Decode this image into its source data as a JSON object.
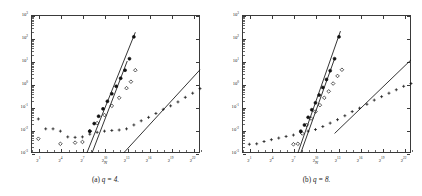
{
  "figure": {
    "panels": [
      {
        "id": "panel-a",
        "caption_prefix": "(a)",
        "caption_expr": "q = 4.",
        "caption_full": "(a) q = 4.",
        "axis": {
          "xlabel": "N",
          "ylabel": "",
          "x_ticks": [
            "2^1",
            "2^4",
            "2^7",
            "2^10",
            "2^13",
            "2^16",
            "2^19",
            "2^22"
          ],
          "x_tick_bases": [
            "2",
            "2",
            "2",
            "2",
            "2",
            "2",
            "2",
            "2"
          ],
          "x_tick_exps": [
            "1",
            "4",
            "7",
            "10",
            "13",
            "16",
            "19",
            "22"
          ],
          "y_ticks": [
            "10^3",
            "10^2",
            "10^1",
            "10^0",
            "10^-1",
            "10^-2",
            "10^-3"
          ],
          "y_tick_bases": [
            "10",
            "10",
            "10",
            "10",
            "10",
            "10",
            "10"
          ],
          "y_tick_exps": [
            "3",
            "2",
            "1",
            "0",
            "-1",
            "-2",
            "-3"
          ],
          "xlim_log2": [
            0,
            23
          ],
          "ylim_log10": [
            -3,
            3
          ],
          "xscale": "log2",
          "yscale": "log10",
          "grid": false
        }
      },
      {
        "id": "panel-b",
        "caption_prefix": "(b)",
        "caption_expr": "q = 8.",
        "caption_full": "(b) q = 8.",
        "axis": {
          "xlabel": "N",
          "ylabel": "",
          "x_ticks": [
            "2^1",
            "2^4",
            "2^7",
            "2^10",
            "2^13",
            "2^16",
            "2^19",
            "2^22"
          ],
          "x_tick_bases": [
            "2",
            "2",
            "2",
            "2",
            "2",
            "2",
            "2",
            "2"
          ],
          "x_tick_exps": [
            "1",
            "4",
            "7",
            "10",
            "13",
            "16",
            "19",
            "22"
          ],
          "y_ticks": [
            "10^3",
            "10^2",
            "10^1",
            "10^0",
            "10^-1",
            "10^-2",
            "10^-3"
          ],
          "y_tick_bases": [
            "10",
            "10",
            "10",
            "10",
            "10",
            "10",
            "10"
          ],
          "y_tick_exps": [
            "3",
            "2",
            "1",
            "0",
            "-1",
            "-2",
            "-3"
          ],
          "xlim_log2": [
            0,
            23
          ],
          "ylim_log10": [
            -3,
            3
          ],
          "xscale": "log2",
          "yscale": "log10",
          "grid": false
        }
      }
    ]
  },
  "chart_data": [
    {
      "type": "scatter",
      "title": "(a) q = 4.",
      "xlabel": "N",
      "ylabel": "",
      "xscale": "log2",
      "yscale": "log10",
      "xlim_log2": [
        0,
        23
      ],
      "ylim_log10": [
        -3,
        3
      ],
      "xticks_log2": [
        1,
        4,
        7,
        10,
        13,
        16,
        19,
        22
      ],
      "yticks_log10": [
        -3,
        -2,
        -1,
        0,
        1,
        2,
        3
      ],
      "grid": false,
      "legend": "none",
      "series": [
        {
          "name": "plus-series",
          "marker": "plus",
          "x_log2": [
            1,
            2,
            3,
            4,
            5,
            6,
            7,
            8,
            9,
            10,
            11,
            12,
            13,
            14,
            15,
            16,
            17,
            18,
            19,
            20,
            21,
            22,
            23
          ],
          "y_log10": [
            -1.52,
            -1.95,
            -1.95,
            -2.05,
            -2.3,
            -2.32,
            -2.3,
            -2.18,
            -2.1,
            -2.05,
            -2.02,
            -2.0,
            -1.95,
            -1.78,
            -1.6,
            -1.45,
            -1.28,
            -1.1,
            -0.95,
            -0.78,
            -0.58,
            -0.4,
            -0.2
          ]
        },
        {
          "name": "diamond-series",
          "marker": "diamond",
          "x_log2": [
            1,
            4,
            6,
            7,
            8,
            9,
            10,
            11,
            12,
            13,
            13.6,
            14.2
          ],
          "y_log10": [
            -2.38,
            -2.6,
            -2.55,
            -2.52,
            -2.05,
            -1.7,
            -1.35,
            -0.95,
            -0.6,
            -0.18,
            0.1,
            0.6
          ]
        },
        {
          "name": "circle-series",
          "marker": "circle",
          "x_log2": [
            8,
            8.6,
            9.2,
            9.8,
            10.4,
            11,
            11.6,
            12.2,
            12.8,
            13.4,
            14
          ],
          "y_log10": [
            -2.05,
            -1.72,
            -1.4,
            -1.08,
            -0.75,
            -0.42,
            -0.1,
            0.25,
            0.6,
            1.1,
            2.05
          ]
        }
      ],
      "reference_lines": [
        {
          "name": "slope-line-circle",
          "x_log2": [
            7.6,
            14.2
          ],
          "y_log10": [
            -3.0,
            2.25
          ]
        },
        {
          "name": "slope-line-diamond",
          "x_log2": [
            8.3,
            13.1
          ],
          "y_log10": [
            -3.0,
            1.0
          ]
        },
        {
          "name": "slope-line-plus",
          "x_log2": [
            12.6,
            23.0
          ],
          "y_log10": [
            -3.0,
            0.62
          ]
        }
      ]
    },
    {
      "type": "scatter",
      "title": "(b) q = 8.",
      "xlabel": "N",
      "ylabel": "",
      "xscale": "log2",
      "yscale": "log10",
      "xlim_log2": [
        0,
        23
      ],
      "ylim_log10": [
        -3,
        3
      ],
      "xticks_log2": [
        1,
        4,
        7,
        10,
        13,
        16,
        19,
        22
      ],
      "yticks_log10": [
        -3,
        -2,
        -1,
        0,
        1,
        2,
        3
      ],
      "grid": false,
      "legend": "none",
      "series": [
        {
          "name": "plus-series",
          "marker": "plus",
          "x_log2": [
            1,
            2,
            3,
            4,
            5,
            6,
            7,
            8,
            9,
            10,
            11,
            12,
            13,
            14,
            15,
            16,
            17,
            18,
            19,
            20,
            21,
            22,
            23
          ],
          "y_log10": [
            -2.62,
            -2.6,
            -2.5,
            -2.42,
            -2.35,
            -2.28,
            -2.22,
            -2.1,
            -2.05,
            -1.98,
            -1.85,
            -1.7,
            -1.55,
            -1.38,
            -1.2,
            -1.05,
            -0.88,
            -0.7,
            -0.55,
            -0.4,
            -0.25,
            -0.1,
            0.02
          ]
        },
        {
          "name": "diamond-series",
          "marker": "diamond",
          "x_log2": [
            7,
            7.6,
            8.2,
            8.8,
            9.4,
            10,
            10.6,
            11.2,
            11.8,
            12.4,
            13.0,
            13.6
          ],
          "y_log10": [
            -2.62,
            -2.6,
            -2.15,
            -1.78,
            -1.5,
            -1.2,
            -0.92,
            -0.6,
            -0.32,
            0.02,
            0.35,
            0.62
          ]
        },
        {
          "name": "circle-series",
          "marker": "circle",
          "x_log2": [
            8,
            8.5,
            9.0,
            9.5,
            10.0,
            10.5,
            11.0,
            11.5,
            12.0,
            12.6,
            13.2
          ],
          "y_log10": [
            -2.05,
            -1.78,
            -1.45,
            -1.12,
            -0.82,
            -0.48,
            -0.15,
            0.2,
            0.58,
            1.1,
            2.05
          ]
        }
      ],
      "reference_lines": [
        {
          "name": "slope-line-circle",
          "x_log2": [
            7.6,
            13.4
          ],
          "y_log10": [
            -3.0,
            2.3
          ]
        },
        {
          "name": "slope-line-diamond",
          "x_log2": [
            8.0,
            12.6
          ],
          "y_log10": [
            -3.0,
            1.1
          ]
        },
        {
          "name": "slope-line-plus",
          "x_log2": [
            12.6,
            23.0
          ],
          "y_log10": [
            -2.15,
            1.05
          ]
        }
      ]
    }
  ],
  "style": {
    "background": "#ffffff",
    "ink": "#111111",
    "frame": "#3a3a3a"
  }
}
